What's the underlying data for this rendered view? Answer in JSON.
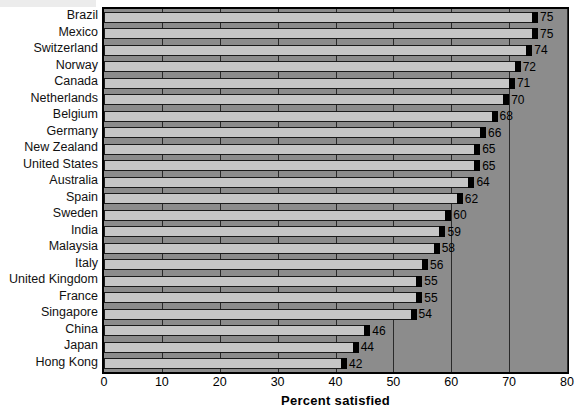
{
  "chart_data": {
    "type": "bar",
    "orientation": "horizontal",
    "title": "",
    "xlabel": "Percent satisfied",
    "ylabel": "",
    "xlim": [
      0,
      80
    ],
    "xticks": [
      0,
      10,
      20,
      30,
      40,
      50,
      60,
      70,
      80
    ],
    "grid": true,
    "legend": null,
    "categories": [
      "Brazil",
      "Mexico",
      "Switzerland",
      "Norway",
      "Canada",
      "Netherlands",
      "Belgium",
      "Germany",
      "New Zealand",
      "United States",
      "Australia",
      "Spain",
      "Sweden",
      "India",
      "Malaysia",
      "Italy",
      "United Kingdom",
      "France",
      "Singapore",
      "China",
      "Japan",
      "Hong Kong"
    ],
    "values": [
      75,
      75,
      74,
      72,
      71,
      70,
      68,
      66,
      65,
      65,
      64,
      62,
      60,
      59,
      58,
      56,
      55,
      55,
      54,
      46,
      44,
      42
    ],
    "value_labels": [
      "75",
      "75",
      "74",
      "72",
      "71",
      "70",
      "68",
      "66",
      "65",
      "65",
      "64",
      "62",
      "60",
      "59",
      "58",
      "56",
      "55",
      "55",
      "54",
      "46",
      "44",
      "42"
    ],
    "xtick_labels": [
      "0",
      "10",
      "20",
      "30",
      "40",
      "50",
      "60",
      "70",
      "80"
    ]
  },
  "colors": {
    "bar_fill": "#c6c6c6",
    "bar_cap": "#000000",
    "bar_outline": "#1a1a1a",
    "plot_background": "#c4c4c4",
    "lane_background": "#8c8c8c",
    "gridline": "#2a2a2a",
    "axis": "#000000",
    "text": "#000000"
  }
}
